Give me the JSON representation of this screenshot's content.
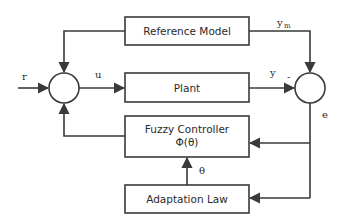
{
  "diagram": {
    "type": "block-diagram",
    "blocks": {
      "reference_model": "Reference Model",
      "plant": "Plant",
      "fuzzy_controller_line1": "Fuzzy Controller",
      "fuzzy_controller_line2": "Φ(θ)",
      "adaptation_law": "Adaptation Law"
    },
    "signals": {
      "r": "r",
      "u": "u",
      "y": "y",
      "ym": "y",
      "ym_sub": "m",
      "e": "e",
      "theta": "θ",
      "minus": "-"
    },
    "colors": {
      "stroke": "#3a3a3a",
      "background": "#ffffff"
    }
  }
}
